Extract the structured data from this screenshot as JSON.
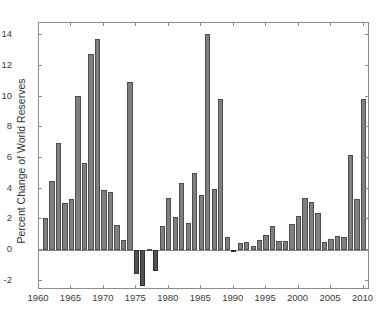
{
  "chart_data": {
    "type": "bar",
    "title": "",
    "subtitle": "",
    "xlabel": "",
    "ylabel": "Percent Change of World Reserves",
    "xlim": [
      1960,
      2011
    ],
    "ylim": [
      -2.6,
      14.8
    ],
    "yticks": [
      -2,
      0,
      2,
      4,
      6,
      8,
      10,
      12,
      14
    ],
    "ytick_labels": [
      "-2",
      "0",
      "2",
      "4",
      "6",
      "8",
      "10",
      "12",
      "14"
    ],
    "xticks": [
      1960,
      1965,
      1970,
      1975,
      1980,
      1985,
      1990,
      1995,
      2000,
      2005,
      2010
    ],
    "xtick_labels": [
      "1960",
      "1965",
      "1970",
      "1975",
      "1980",
      "1985",
      "1990",
      "1995",
      "2000",
      "2005",
      "2010"
    ],
    "grid": false,
    "legend": null,
    "bar_color": "#808080",
    "bar_edge_color": "#4d4d4d",
    "negative_bar_color": "#545454",
    "axis_color": "#8c8c8c",
    "background": "#ffffff",
    "categories": [
      1961,
      1962,
      1963,
      1964,
      1965,
      1966,
      1967,
      1968,
      1969,
      1970,
      1971,
      1972,
      1973,
      1974,
      1975,
      1976,
      1977,
      1978,
      1979,
      1980,
      1981,
      1982,
      1983,
      1984,
      1985,
      1986,
      1987,
      1988,
      1989,
      1990,
      1991,
      1992,
      1993,
      1994,
      1995,
      1996,
      1997,
      1998,
      1999,
      2000,
      2001,
      2002,
      2003,
      2004,
      2005,
      2006,
      2007,
      2008,
      2009,
      2010
    ],
    "values": [
      2.1,
      4.5,
      6.95,
      3.05,
      3.3,
      10.05,
      5.7,
      12.8,
      13.75,
      3.9,
      3.8,
      1.65,
      0.65,
      10.95,
      -1.55,
      -2.35,
      0.05,
      -1.35,
      1.6,
      3.4,
      2.15,
      4.4,
      1.75,
      5.0,
      3.6,
      14.1,
      4.0,
      9.85,
      0.85,
      -0.15,
      0.45,
      0.55,
      0.25,
      0.65,
      1.0,
      1.55,
      0.6,
      0.6,
      1.7,
      2.25,
      3.4,
      3.15,
      2.4,
      0.55,
      0.75,
      0.95,
      0.85,
      6.2,
      3.35,
      9.85
    ]
  }
}
